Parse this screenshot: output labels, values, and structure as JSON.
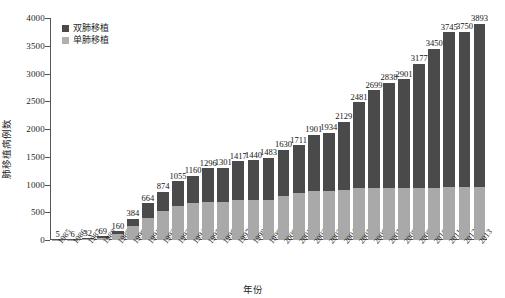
{
  "chart_data": {
    "type": "bar",
    "subtype": "stacked-bar",
    "title": "",
    "xlabel": "年份",
    "ylabel": "肺移植病例数",
    "ylim": [
      0,
      4000
    ],
    "yticks": [
      0,
      500,
      1000,
      1500,
      2000,
      2500,
      3000,
      3500,
      4000
    ],
    "grid": false,
    "legend_position": "top-left",
    "categories": [
      "1985",
      "1986",
      "1987",
      "1988",
      "1989",
      "1990",
      "1991",
      "1992",
      "1993",
      "1994",
      "1995",
      "1996",
      "1997",
      "1998",
      "1999",
      "2000",
      "2001",
      "2002",
      "2003",
      "2004",
      "2005",
      "2006",
      "2007",
      "2008",
      "2009",
      "2010",
      "2011",
      "2012",
      "2013"
    ],
    "series": [
      {
        "name": "单肺移植",
        "color": "#a9a9a9",
        "values": [
          3,
          4,
          20,
          45,
          110,
          250,
          405,
          520,
          620,
          665,
          690,
          690,
          730,
          715,
          720,
          790,
          850,
          880,
          880,
          900,
          930,
          930,
          940,
          930,
          940,
          945,
          950,
          950,
          955
        ]
      },
      {
        "name": "双肺移植",
        "color": "#4a4a4a",
        "values": [
          2,
          2,
          12,
          24,
          50,
          134,
          259,
          354,
          435,
          495,
          606,
          611,
          687,
          725,
          763,
          840,
          861,
          1021,
          1054,
          1229,
          1551,
          1769,
          1898,
          1971,
          2237,
          2505,
          2795,
          2800,
          2938
        ]
      }
    ],
    "totals": [
      5,
      6,
      32,
      69,
      160,
      384,
      664,
      874,
      1055,
      1160,
      1296,
      1301,
      1417,
      1440,
      1483,
      1630,
      1711,
      1901,
      1934,
      2129,
      2481,
      2699,
      2838,
      2901,
      3177,
      3450,
      3745,
      3750,
      3893
    ]
  },
  "legend": {
    "items": [
      {
        "label": "双肺移植",
        "color": "#4a4a4a"
      },
      {
        "label": "单肺移植",
        "color": "#b0b0b0"
      }
    ]
  }
}
